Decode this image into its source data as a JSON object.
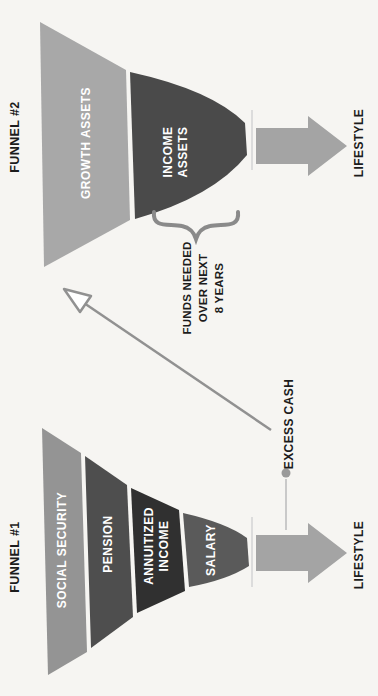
{
  "funnel1": {
    "title": "FUNNEL #1",
    "layers": [
      {
        "label": "SOCIAL SECURITY",
        "color": "#949494"
      },
      {
        "label": "PENSION",
        "color": "#4e4e4e"
      },
      {
        "label_line1": "ANNUITIZED",
        "label_line2": "INCOME",
        "color": "#303030"
      },
      {
        "label": "SALARY",
        "color": "#5a5a5a"
      }
    ],
    "output_label": "LIFESTYLE"
  },
  "funnel2": {
    "title": "FUNNEL #2",
    "layers": [
      {
        "label": "GROWTH ASSETS",
        "color": "#a8a8a8"
      },
      {
        "label_line1": "INCOME",
        "label_line2": "ASSETS",
        "color": "#4a4a4a"
      }
    ],
    "output_label": "LIFESTYLE"
  },
  "annotations": {
    "excess_cash_label": "EXCESS CASH",
    "funds_needed_line1": "FUNDS NEEDED",
    "funds_needed_line2": "OVER NEXT",
    "funds_needed_line3": "8 YEARS"
  },
  "colors": {
    "background": "#f6f5f2",
    "lifestyle_arrow": "#a4a4a4",
    "annotation_gray": "#919191",
    "brace_gray": "#8a8a8a",
    "callout_stem": "#c9c9c9",
    "callout_dot": "#9a9a9a",
    "layer_text": "#ffffff",
    "label_text": "#1c1c1c"
  }
}
